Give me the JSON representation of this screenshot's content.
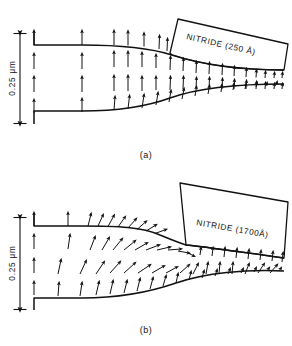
{
  "figure": {
    "background_color": "#ffffff",
    "ink_color": "#111111"
  },
  "panels": [
    {
      "id": "a",
      "caption": "(a)",
      "nitride_label": "NITRIDE (250 Å)",
      "nitride_thickness_angstrom": 250,
      "axis": {
        "label": "0.25 μm",
        "value": 0.25,
        "unit": "μm",
        "orientation": "vertical",
        "tick_style": "double-arrow"
      }
    },
    {
      "id": "b",
      "caption": "(b)",
      "nitride_label": "NITRIDE (1700Å)",
      "nitride_thickness_angstrom": 1700,
      "axis": {
        "label": "0.25 μm",
        "value": 0.25,
        "unit": "μm",
        "orientation": "vertical",
        "tick_style": "double-arrow"
      }
    }
  ],
  "chart_data": {
    "type": "scatter",
    "xlabel": "",
    "ylabel": "0.25 μm",
    "grid": false,
    "legend_position": "none",
    "annotations": [
      "NITRIDE (250 Å)",
      "NITRIDE (1700Å)",
      "(a)",
      "(b)",
      "0.25 μm"
    ],
    "panels": [
      {
        "id": "a",
        "annotation": "NITRIDE (250 Å)",
        "caption": "(a)",
        "top_surface_path": "M34,31 L34,45 L82,45 C120,45 150,48 172,55 C200,64 240,70 284,70",
        "bottom_surface_path": "M34,124 L34,111 L82,111 C120,111 148,106 170,98 C198,88 240,84 284,84",
        "nitride_block_path": "M170,53 L178,19 L288,44 L284,70 C240,70 200,64 172,55 Z",
        "nitride_text": {
          "x": 186,
          "y": 39,
          "rotate": 13
        },
        "caption_pos": {
          "x": 146,
          "y": 158
        },
        "axis_bar": {
          "x": 20,
          "y_top": 33,
          "y_bottom": 124,
          "label_x": 15,
          "label_y": 78
        },
        "vector_rows_y": [
          45,
          69,
          92,
          113
        ],
        "vectors": [
          {
            "x": 34,
            "y": 45,
            "dx": 0,
            "dy": -14
          },
          {
            "x": 82,
            "y": 45,
            "dx": 0,
            "dy": -14
          },
          {
            "x": 114,
            "y": 45,
            "dx": 0,
            "dy": -14
          },
          {
            "x": 128,
            "y": 45.5,
            "dx": 0,
            "dy": -14
          },
          {
            "x": 144,
            "y": 46.5,
            "dx": 0,
            "dy": -13
          },
          {
            "x": 159,
            "y": 49,
            "dx": 0.5,
            "dy": -13
          },
          {
            "x": 167,
            "y": 51,
            "dx": 0.5,
            "dy": -12
          },
          {
            "x": 34,
            "y": 69,
            "dx": 0,
            "dy": -15
          },
          {
            "x": 82,
            "y": 69,
            "dx": 0,
            "dy": -15
          },
          {
            "x": 114,
            "y": 67,
            "dx": 0,
            "dy": -15
          },
          {
            "x": 128,
            "y": 67,
            "dx": 0,
            "dy": -15
          },
          {
            "x": 142,
            "y": 67,
            "dx": 0,
            "dy": -14
          },
          {
            "x": 156,
            "y": 68,
            "dx": 0,
            "dy": -13
          },
          {
            "x": 170,
            "y": 70,
            "dx": 0.5,
            "dy": -13
          },
          {
            "x": 183,
            "y": 71,
            "dx": 0.5,
            "dy": -12
          },
          {
            "x": 196,
            "y": 73,
            "dx": 0.5,
            "dy": -11
          },
          {
            "x": 209,
            "y": 74,
            "dx": 0.5,
            "dy": -11
          },
          {
            "x": 222,
            "y": 75,
            "dx": 0.5,
            "dy": -10
          },
          {
            "x": 234,
            "y": 76,
            "dx": 0.5,
            "dy": -9
          },
          {
            "x": 246,
            "y": 77,
            "dx": 0.5,
            "dy": -8
          },
          {
            "x": 256,
            "y": 77.5,
            "dx": 0.5,
            "dy": -7
          },
          {
            "x": 265,
            "y": 78,
            "dx": 0.5,
            "dy": -6
          },
          {
            "x": 274,
            "y": 78,
            "dx": 0.5,
            "dy": -5
          },
          {
            "x": 282,
            "y": 78,
            "dx": 0.5,
            "dy": -5
          },
          {
            "x": 34,
            "y": 92,
            "dx": 0,
            "dy": -15
          },
          {
            "x": 82,
            "y": 92,
            "dx": 0,
            "dy": -15
          },
          {
            "x": 114,
            "y": 91,
            "dx": 0,
            "dy": -15
          },
          {
            "x": 128,
            "y": 91,
            "dx": 0,
            "dy": -15
          },
          {
            "x": 142,
            "y": 91,
            "dx": 0,
            "dy": -14
          },
          {
            "x": 156,
            "y": 90,
            "dx": 0,
            "dy": -13
          },
          {
            "x": 170,
            "y": 90,
            "dx": 0.5,
            "dy": -13
          },
          {
            "x": 183,
            "y": 89,
            "dx": 0.5,
            "dy": -12
          },
          {
            "x": 196,
            "y": 89,
            "dx": 0.5,
            "dy": -11
          },
          {
            "x": 209,
            "y": 89,
            "dx": 0.5,
            "dy": -11
          },
          {
            "x": 222,
            "y": 89,
            "dx": 0.5,
            "dy": -10
          },
          {
            "x": 234,
            "y": 89,
            "dx": 0.5,
            "dy": -9
          },
          {
            "x": 246,
            "y": 89,
            "dx": 0.5,
            "dy": -8
          },
          {
            "x": 256,
            "y": 89,
            "dx": 0.5,
            "dy": -7
          },
          {
            "x": 265,
            "y": 89,
            "dx": 0.5,
            "dy": -6
          },
          {
            "x": 274,
            "y": 89,
            "dx": 0.5,
            "dy": -5
          },
          {
            "x": 282,
            "y": 89,
            "dx": 0.5,
            "dy": -5
          },
          {
            "x": 34,
            "y": 113,
            "dx": 0,
            "dy": -13
          },
          {
            "x": 82,
            "y": 112,
            "dx": 0,
            "dy": -13
          },
          {
            "x": 114,
            "y": 110,
            "dx": 1,
            "dy": -13
          },
          {
            "x": 128,
            "y": 109,
            "dx": 1.5,
            "dy": -13
          },
          {
            "x": 142,
            "y": 108,
            "dx": 2,
            "dy": -13
          },
          {
            "x": 156,
            "y": 105,
            "dx": 2,
            "dy": -12
          },
          {
            "x": 169,
            "y": 102,
            "dx": 2,
            "dy": -11
          },
          {
            "x": 182,
            "y": 99,
            "dx": 2,
            "dy": -10
          },
          {
            "x": 195,
            "y": 96,
            "dx": 1.5,
            "dy": -9
          },
          {
            "x": 208,
            "y": 94,
            "dx": 1.5,
            "dy": -8
          },
          {
            "x": 221,
            "y": 92,
            "dx": 1,
            "dy": -7
          },
          {
            "x": 233,
            "y": 90,
            "dx": 1,
            "dy": -6
          },
          {
            "x": 245,
            "y": 89,
            "dx": 1,
            "dy": -5
          },
          {
            "x": 256,
            "y": 87,
            "dx": 1,
            "dy": -4
          },
          {
            "x": 266,
            "y": 86,
            "dx": 1,
            "dy": -3
          },
          {
            "x": 276,
            "y": 85,
            "dx": 1,
            "dy": -3
          }
        ]
      },
      {
        "id": "b",
        "annotation": "NITRIDE (1700Å)",
        "caption": "(b)",
        "top_surface_path": "M34,40 L34,53 L82,53 C118,53 142,54 160,62 C172,67 180,70 186,72 C200,73 240,79 284,85",
        "bottom_surface_path": "M34,137 L34,125 L82,125 C120,125 150,119 176,110 C205,100 246,96 284,98",
        "nitride_block_path": "M186,72 L180,10 L288,29 L284,85 C240,79 200,73 186,72 Z",
        "nitride_text": {
          "x": 196,
          "y": 52,
          "rotate": 10
        },
        "caption_pos": {
          "x": 146,
          "y": 160
        },
        "axis_bar": {
          "x": 20,
          "y_top": 44,
          "y_bottom": 137,
          "label_x": 15,
          "label_y": 90
        },
        "vector_rows_y": [
          53,
          76,
          100,
          122
        ],
        "vectors": [
          {
            "x": 34,
            "y": 53,
            "dx": 0,
            "dy": -13
          },
          {
            "x": 68,
            "y": 53,
            "dx": 0,
            "dy": -13
          },
          {
            "x": 88,
            "y": 53,
            "dx": 3,
            "dy": -12
          },
          {
            "x": 98,
            "y": 53,
            "dx": 5,
            "dy": -11
          },
          {
            "x": 108,
            "y": 53.5,
            "dx": 6,
            "dy": -11
          },
          {
            "x": 118,
            "y": 54,
            "dx": 7,
            "dy": -10
          },
          {
            "x": 128,
            "y": 55,
            "dx": 8,
            "dy": -9
          },
          {
            "x": 137,
            "y": 56.5,
            "dx": 9,
            "dy": -8
          },
          {
            "x": 146,
            "y": 58,
            "dx": 10,
            "dy": -6
          },
          {
            "x": 155,
            "y": 60.5,
            "dx": 11,
            "dy": -4
          },
          {
            "x": 34,
            "y": 76,
            "dx": 0,
            "dy": -14
          },
          {
            "x": 68,
            "y": 76,
            "dx": 2,
            "dy": -14
          },
          {
            "x": 90,
            "y": 77,
            "dx": 5,
            "dy": -13
          },
          {
            "x": 102,
            "y": 77,
            "dx": 7,
            "dy": -12
          },
          {
            "x": 113,
            "y": 77,
            "dx": 9,
            "dy": -11
          },
          {
            "x": 124,
            "y": 77,
            "dx": 11,
            "dy": -9
          },
          {
            "x": 135,
            "y": 77,
            "dx": 12,
            "dy": -7
          },
          {
            "x": 146,
            "y": 77,
            "dx": 13,
            "dy": -5
          },
          {
            "x": 157,
            "y": 77,
            "dx": 13,
            "dy": -3
          },
          {
            "x": 168,
            "y": 77,
            "dx": 13,
            "dy": -1
          },
          {
            "x": 178,
            "y": 78,
            "dx": 11,
            "dy": 2
          },
          {
            "x": 188,
            "y": 80,
            "dx": 6,
            "dy": 3
          },
          {
            "x": 200,
            "y": 82,
            "dx": 1,
            "dy": -7
          },
          {
            "x": 212,
            "y": 83,
            "dx": 1,
            "dy": -8
          },
          {
            "x": 224,
            "y": 84,
            "dx": 1,
            "dy": -9
          },
          {
            "x": 236,
            "y": 85,
            "dx": 1,
            "dy": -9
          },
          {
            "x": 248,
            "y": 86,
            "dx": 1,
            "dy": -9
          },
          {
            "x": 260,
            "y": 87,
            "dx": 1,
            "dy": -9
          },
          {
            "x": 272,
            "y": 88,
            "dx": 1,
            "dy": -9
          },
          {
            "x": 282,
            "y": 89,
            "dx": 1,
            "dy": -9
          },
          {
            "x": 34,
            "y": 100,
            "dx": 0,
            "dy": -14
          },
          {
            "x": 58,
            "y": 101,
            "dx": 3,
            "dy": -14
          },
          {
            "x": 80,
            "y": 101,
            "dx": 6,
            "dy": -13
          },
          {
            "x": 96,
            "y": 101,
            "dx": 8,
            "dy": -12
          },
          {
            "x": 110,
            "y": 100,
            "dx": 10,
            "dy": -11
          },
          {
            "x": 124,
            "y": 100,
            "dx": 11,
            "dy": -10
          },
          {
            "x": 138,
            "y": 100,
            "dx": 12,
            "dy": -8
          },
          {
            "x": 152,
            "y": 100,
            "dx": 12,
            "dy": -7
          },
          {
            "x": 166,
            "y": 100,
            "dx": 11,
            "dy": -6
          },
          {
            "x": 180,
            "y": 100,
            "dx": 9,
            "dy": -8
          },
          {
            "x": 193,
            "y": 101,
            "dx": 5,
            "dy": -10
          },
          {
            "x": 206,
            "y": 101,
            "dx": 2,
            "dy": -11
          },
          {
            "x": 219,
            "y": 101,
            "dx": 1,
            "dy": -11
          },
          {
            "x": 232,
            "y": 101,
            "dx": 1,
            "dy": -11
          },
          {
            "x": 245,
            "y": 101,
            "dx": 4,
            "dy": -10
          },
          {
            "x": 258,
            "y": 100,
            "dx": 6,
            "dy": -9
          },
          {
            "x": 270,
            "y": 100,
            "dx": 7,
            "dy": -8
          },
          {
            "x": 34,
            "y": 122,
            "dx": 0,
            "dy": -13
          },
          {
            "x": 58,
            "y": 123,
            "dx": 1,
            "dy": -13
          },
          {
            "x": 80,
            "y": 123,
            "dx": 2,
            "dy": -13
          },
          {
            "x": 96,
            "y": 122,
            "dx": 3,
            "dy": -13
          },
          {
            "x": 110,
            "y": 121,
            "dx": 3,
            "dy": -13
          },
          {
            "x": 124,
            "y": 120,
            "dx": 3,
            "dy": -12
          },
          {
            "x": 137,
            "y": 118,
            "dx": 3,
            "dy": -12
          },
          {
            "x": 150,
            "y": 116,
            "dx": 3,
            "dy": -11
          },
          {
            "x": 163,
            "y": 113,
            "dx": 3,
            "dy": -10
          },
          {
            "x": 176,
            "y": 110,
            "dx": 2,
            "dy": -9
          },
          {
            "x": 189,
            "y": 107,
            "dx": 2,
            "dy": -8
          },
          {
            "x": 202,
            "y": 105,
            "dx": 2,
            "dy": -7
          },
          {
            "x": 215,
            "y": 103,
            "dx": 2,
            "dy": -6
          },
          {
            "x": 228,
            "y": 101,
            "dx": 2,
            "dy": -5
          },
          {
            "x": 241,
            "y": 100,
            "dx": 2,
            "dy": -4
          },
          {
            "x": 254,
            "y": 99,
            "dx": 2,
            "dy": -4
          },
          {
            "x": 267,
            "y": 98,
            "dx": 2,
            "dy": -3
          },
          {
            "x": 279,
            "y": 98,
            "dx": 2,
            "dy": -3
          }
        ]
      }
    ]
  }
}
